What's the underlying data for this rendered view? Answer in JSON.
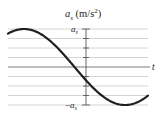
{
  "chart_data": {
    "type": "line",
    "title": "",
    "ylabel": "a_s (m/s^2)",
    "ylabel_parts": {
      "var": "a",
      "sub": "s",
      "unit_open": " (m/s",
      "sup": "2",
      "unit_close": ")"
    },
    "xlabel": "t",
    "y_tick_labels": {
      "top": {
        "var": "a",
        "sub": "s"
      },
      "bottom": {
        "prefix": "−",
        "var": "a",
        "sub": "s"
      }
    },
    "ylim": [
      -1,
      1
    ],
    "grid": true,
    "gridlines_y": [
      1,
      0.75,
      0.5,
      0.25,
      0,
      -0.25,
      -0.5,
      -0.75,
      -1
    ],
    "series": [
      {
        "name": "a_s(t)",
        "function": "cosine",
        "description": "acceleration vs time; positive maximum before t=0, decreasing through zero just before t=0, value about -0.25 at t=0, minimum after t=0",
        "x_px": [
          8,
          24,
          50,
          78,
          86,
          100,
          125,
          148
        ],
        "values": [
          0.97,
          1.0,
          0.71,
          0.0,
          -0.24,
          -0.62,
          -1.0,
          -0.86
        ]
      }
    ],
    "colors": {
      "curve": "#231f20",
      "axis": "#6d6e71",
      "grid": "#bcbec0"
    }
  }
}
